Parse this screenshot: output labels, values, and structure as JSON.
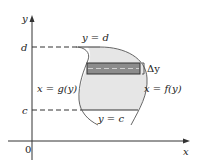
{
  "diagram": {
    "axes": {
      "x_label": "x",
      "y_label": "y",
      "origin_label": "0"
    },
    "levels": {
      "top_label": "d",
      "bottom_label": "c"
    },
    "curves": {
      "top_boundary": "y = d",
      "bottom_boundary": "y = c",
      "left_curve": "x = g(y)",
      "right_curve": "x = f(y)"
    },
    "strip": {
      "thickness_label": "Δy"
    },
    "colors": {
      "region_fill": "#e6e6e6",
      "strip_fill": "#8c8c8c",
      "line": "#333333"
    }
  }
}
